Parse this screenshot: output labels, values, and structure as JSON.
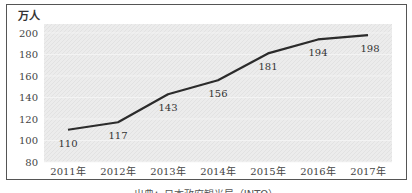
{
  "chart_data": {
    "type": "line",
    "title": "",
    "unit_label": "万人",
    "categories": [
      "2011年",
      "2012年",
      "2013年",
      "2014年",
      "2015年",
      "2016年",
      "2017年"
    ],
    "series": [
      {
        "name": "",
        "values": [
          110,
          117,
          143,
          156,
          181,
          194,
          198
        ]
      }
    ],
    "data_labels": [
      "110",
      "117",
      "143",
      "156",
      "181",
      "194",
      "198"
    ],
    "yticks": [
      80,
      100,
      120,
      140,
      160,
      180,
      200
    ],
    "ylim": [
      80,
      210
    ],
    "xlabel": "",
    "ylabel": "万人",
    "grid": true,
    "legend": "none"
  },
  "caption": "出典：日本政府観光局（JNTO）",
  "colors": {
    "line": "#2b2b2b",
    "plot_bg": "#ececec",
    "frame": "#555555"
  }
}
